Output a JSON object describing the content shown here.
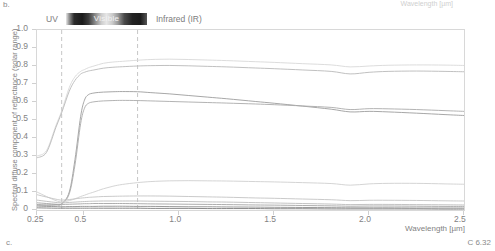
{
  "figure": {
    "panel_label_top": "b.",
    "panel_label_bottom": "c.",
    "figure_code": "C 6.32",
    "ghost_top_label": "Wavelength [µm]"
  },
  "bands": {
    "uv_label": "UV",
    "visible_label": "Visible",
    "ir_label": "Infrared (IR)",
    "uv_visible_boundary_um": 0.38,
    "visible_ir_boundary_um": 0.78
  },
  "chart_data": {
    "type": "line",
    "title": "",
    "xlabel": "Wavelength [µm]",
    "ylabel": "Spectral diffuse component of reflectance (solar range)",
    "xlim": [
      0.25,
      2.5
    ],
    "ylim": [
      0,
      1.0
    ],
    "xticks": [
      0.25,
      0.5,
      1.0,
      1.5,
      2.0,
      2.5
    ],
    "xticklabels": [
      "0.25",
      "0.5",
      "1.0",
      "1.5",
      "2.0",
      "2.5"
    ],
    "yticks": [
      0,
      0.1,
      0.2,
      0.3,
      0.4,
      0.5,
      0.6,
      0.7,
      0.8,
      0.9,
      1.0
    ],
    "yticklabels": [
      "0",
      "0.1",
      "0.2",
      "0.3",
      "0.4",
      "0.5",
      "0.6",
      "0.7",
      "0.8",
      "0.9",
      "1.0"
    ],
    "grid": false,
    "legend_position": "none",
    "annotations": [
      {
        "text": "UV",
        "x_um": 0.3,
        "y": 0.99
      },
      {
        "text": "Visible",
        "x_um": 0.58,
        "y": 0.99
      },
      {
        "text": "Infrared (IR)",
        "x_um": 1.0,
        "y": 0.99
      }
    ],
    "vertical_markers_um": [
      0.38,
      0.78
    ],
    "x": [
      0.25,
      0.3,
      0.35,
      0.38,
      0.42,
      0.45,
      0.48,
      0.5,
      0.52,
      0.55,
      0.6,
      0.65,
      0.7,
      0.78,
      0.85,
      0.95,
      1.05,
      1.15,
      1.25,
      1.4,
      1.5,
      1.65,
      1.8,
      1.9,
      2.0,
      2.1,
      2.25,
      2.4,
      2.5
    ],
    "series": [
      {
        "name": "white coating 1",
        "color": "#d8d8d8",
        "values": [
          0.3,
          0.33,
          0.47,
          0.55,
          0.68,
          0.74,
          0.77,
          0.78,
          0.79,
          0.8,
          0.815,
          0.822,
          0.826,
          0.832,
          0.836,
          0.838,
          0.836,
          0.833,
          0.83,
          0.824,
          0.82,
          0.813,
          0.806,
          0.795,
          0.8,
          0.804,
          0.806,
          0.805,
          0.803
        ]
      },
      {
        "name": "white coating 2",
        "color": "#b9b9b9",
        "values": [
          0.29,
          0.32,
          0.46,
          0.54,
          0.66,
          0.72,
          0.755,
          0.765,
          0.772,
          0.778,
          0.788,
          0.793,
          0.796,
          0.8,
          0.802,
          0.803,
          0.801,
          0.798,
          0.795,
          0.789,
          0.785,
          0.778,
          0.77,
          0.756,
          0.765,
          0.77,
          0.772,
          0.77,
          0.768
        ]
      },
      {
        "name": "light grey coating",
        "color": "#9d9d9d",
        "values": [
          0.03,
          0.028,
          0.03,
          0.035,
          0.1,
          0.28,
          0.52,
          0.61,
          0.64,
          0.65,
          0.655,
          0.657,
          0.658,
          0.657,
          0.652,
          0.645,
          0.636,
          0.627,
          0.618,
          0.603,
          0.593,
          0.577,
          0.56,
          0.545,
          0.548,
          0.545,
          0.538,
          0.53,
          0.525
        ]
      },
      {
        "name": "medium grey coating",
        "color": "#aaaaaa",
        "values": [
          0.028,
          0.026,
          0.028,
          0.033,
          0.09,
          0.25,
          0.48,
          0.565,
          0.592,
          0.601,
          0.606,
          0.608,
          0.609,
          0.608,
          0.606,
          0.603,
          0.6,
          0.597,
          0.594,
          0.589,
          0.585,
          0.578,
          0.57,
          0.558,
          0.563,
          0.562,
          0.558,
          0.552,
          0.548
        ]
      },
      {
        "name": "pale tinted surface",
        "color": "#cfcfcf",
        "values": [
          0.1,
          0.075,
          0.052,
          0.045,
          0.052,
          0.062,
          0.075,
          0.082,
          0.09,
          0.1,
          0.118,
          0.132,
          0.142,
          0.152,
          0.158,
          0.162,
          0.163,
          0.162,
          0.161,
          0.158,
          0.156,
          0.152,
          0.147,
          0.138,
          0.145,
          0.148,
          0.148,
          0.145,
          0.143
        ]
      },
      {
        "name": "low reflectance surface 1",
        "color": "#c4c4c4",
        "values": [
          0.085,
          0.072,
          0.06,
          0.055,
          0.058,
          0.062,
          0.066,
          0.068,
          0.07,
          0.072,
          0.075,
          0.076,
          0.077,
          0.078,
          0.078,
          0.077,
          0.075,
          0.073,
          0.071,
          0.067,
          0.065,
          0.061,
          0.057,
          0.052,
          0.054,
          0.054,
          0.053,
          0.051,
          0.05
        ]
      },
      {
        "name": "low reflectance surface 2",
        "color": "#bcbcbc",
        "values": [
          0.055,
          0.048,
          0.042,
          0.04,
          0.042,
          0.044,
          0.046,
          0.047,
          0.048,
          0.049,
          0.05,
          0.05,
          0.05,
          0.05,
          0.049,
          0.048,
          0.047,
          0.045,
          0.044,
          0.041,
          0.039,
          0.036,
          0.033,
          0.03,
          0.031,
          0.031,
          0.03,
          0.029,
          0.028
        ]
      },
      {
        "name": "dark surface 1",
        "color": "#a4a4a4",
        "values": [
          0.04,
          0.036,
          0.032,
          0.031,
          0.032,
          0.033,
          0.034,
          0.035,
          0.035,
          0.036,
          0.036,
          0.036,
          0.036,
          0.035,
          0.034,
          0.033,
          0.032,
          0.031,
          0.03,
          0.028,
          0.027,
          0.025,
          0.023,
          0.021,
          0.022,
          0.022,
          0.021,
          0.02,
          0.02
        ]
      },
      {
        "name": "dark surface 2",
        "color": "#8e8e8e",
        "values": [
          0.022,
          0.02,
          0.019,
          0.018,
          0.019,
          0.019,
          0.02,
          0.02,
          0.02,
          0.02,
          0.021,
          0.021,
          0.021,
          0.02,
          0.02,
          0.019,
          0.018,
          0.018,
          0.017,
          0.016,
          0.015,
          0.014,
          0.013,
          0.012,
          0.012,
          0.012,
          0.011,
          0.011,
          0.011
        ]
      },
      {
        "name": "black surface",
        "color": "#7c7c7c",
        "values": [
          0.012,
          0.011,
          0.01,
          0.01,
          0.01,
          0.01,
          0.01,
          0.01,
          0.01,
          0.01,
          0.01,
          0.01,
          0.01,
          0.01,
          0.009,
          0.009,
          0.009,
          0.008,
          0.008,
          0.008,
          0.007,
          0.007,
          0.006,
          0.006,
          0.006,
          0.006,
          0.006,
          0.005,
          0.005
        ]
      }
    ]
  }
}
